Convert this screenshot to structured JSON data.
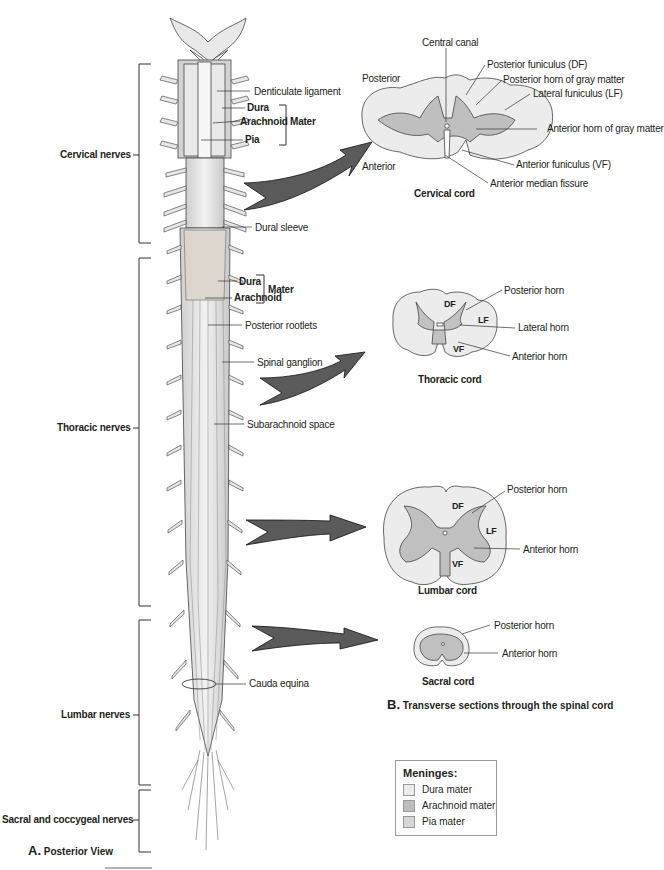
{
  "panel_a": {
    "caption_letter": "A.",
    "caption_text": "Posterior View",
    "regions": [
      {
        "label": "Cervical nerves"
      },
      {
        "label": "Thoracic nerves"
      },
      {
        "label": "Lumbar nerves"
      },
      {
        "label": "Sacral and coccygeal nerves"
      }
    ],
    "labels": {
      "denticulate_ligament": "Denticulate ligament",
      "dura_top": "Dura",
      "arachnoid_top": "Arachnoid",
      "pia": "Pia",
      "mater_top": "Mater",
      "dural_sleeve": "Dural sleeve",
      "dura_mid": "Dura",
      "arachnoid_mid": "Arachnoid",
      "mater_mid": "Mater",
      "posterior_rootlets": "Posterior rootlets",
      "spinal_ganglion": "Spinal ganglion",
      "subarachnoid_space": "Subarachnoid space",
      "cauda_equina": "Cauda equina"
    }
  },
  "panel_b": {
    "caption_letter": "B.",
    "caption_text": "Transverse sections through the spinal cord",
    "cervical": {
      "title": "Cervical cord",
      "posterior": "Posterior",
      "anterior": "Anterior",
      "central_canal": "Central canal",
      "posterior_funiculus": "Posterior funiculus (DF)",
      "posterior_horn": "Posterior horn of gray matter",
      "lateral_funiculus": "Lateral funiculus (LF)",
      "anterior_horn": "Anterior horn of gray matter",
      "anterior_funiculus": "Anterior funiculus (VF)",
      "anterior_median_fissure": "Anterior median fissure"
    },
    "thoracic": {
      "title": "Thoracic cord",
      "df": "DF",
      "lf": "LF",
      "vf": "VF",
      "posterior_horn": "Posterior horn",
      "lateral_horn": "Lateral horn",
      "anterior_horn": "Anterior horn"
    },
    "lumbar": {
      "title": "Lumbar cord",
      "df": "DF",
      "lf": "LF",
      "vf": "VF",
      "posterior_horn": "Posterior horn",
      "anterior_horn": "Anterior horn"
    },
    "sacral": {
      "title": "Sacral cord",
      "posterior_horn": "Posterior horn",
      "anterior_horn": "Anterior horn"
    }
  },
  "legend": {
    "title": "Meninges:",
    "items": [
      {
        "label": "Dura mater",
        "color": "#ececec"
      },
      {
        "label": "Arachnoid mater",
        "color": "#bdbdbd"
      },
      {
        "label": "Pia mater",
        "color": "#d6d6d6"
      }
    ]
  },
  "colors": {
    "white_matter": "#ededed",
    "gray_matter": "#c2c2c2",
    "arrow": "#5a5a5a",
    "line": "#231f20"
  }
}
